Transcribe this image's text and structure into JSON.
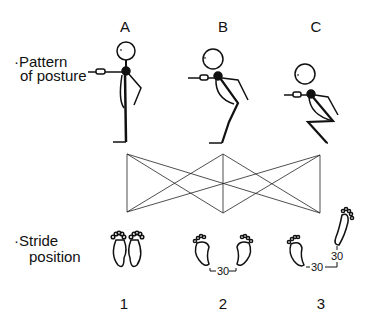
{
  "columns": [
    {
      "letter": "A",
      "number": "1",
      "stride_label": ""
    },
    {
      "letter": "B",
      "number": "2",
      "stride_label": "30"
    },
    {
      "letter": "C",
      "number": "3",
      "stride_label": "30",
      "stride_label_vertical": "30"
    }
  ],
  "row_labels": {
    "posture_line1": "·Pattern",
    "posture_line2": "of posture",
    "stride_line1": "·Stride",
    "stride_line2": "position"
  }
}
